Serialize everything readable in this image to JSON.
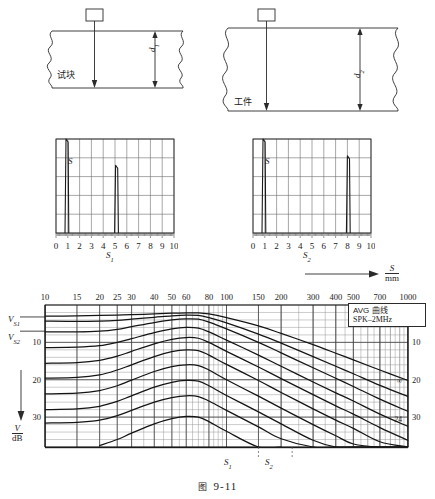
{
  "figure": {
    "caption_prefix": "图",
    "caption_number": "9-11"
  },
  "specimens": [
    {
      "name": "test-block",
      "material_label": "试块",
      "depth_label": "d",
      "depth_sub": "1",
      "probe_label": ""
    },
    {
      "name": "workpiece",
      "material_label": "工件",
      "depth_label": "d",
      "depth_sub": "2",
      "probe_label": ""
    }
  ],
  "scope_charts": [
    {
      "name": "scope-s1",
      "axis_label": "S",
      "axis_sub": "1",
      "signal_label": "S",
      "ticks": [
        "0",
        "1",
        "2",
        "3",
        "4",
        "5",
        "6",
        "7",
        "8",
        "9",
        "10"
      ],
      "xmin": 0,
      "xmax": 10,
      "echoes": [
        {
          "position": 0.95,
          "height": 1.0
        },
        {
          "position": 5.15,
          "height": 0.72
        }
      ],
      "grid_cols": 10,
      "grid_rows": 5
    },
    {
      "name": "scope-s2",
      "axis_label": "S",
      "axis_sub": "2",
      "signal_label": "S",
      "ticks": [
        "0",
        "1",
        "2",
        "3",
        "4",
        "5",
        "6",
        "7",
        "8",
        "9",
        "10"
      ],
      "xmin": 0,
      "xmax": 10,
      "echoes": [
        {
          "position": 0.95,
          "height": 1.0
        },
        {
          "position": 8.1,
          "height": 0.82
        }
      ],
      "grid_cols": 10,
      "grid_rows": 5
    }
  ],
  "chart_data": {
    "type": "line",
    "title": "AVG 曲线",
    "legend": [
      "AVG 曲线",
      "SPK–2MHz"
    ],
    "legend_position": "top-right-inside",
    "xlabel": "S",
    "xunit": "mm",
    "ylabel": "V",
    "yunit": "dB",
    "xscale": "log",
    "xlim": [
      10,
      1000
    ],
    "ylim": [
      0,
      38
    ],
    "grid": true,
    "xticks": [
      "10",
      "15",
      "20",
      "25",
      "30",
      "40",
      "50",
      "60",
      "80",
      "100",
      "150",
      "200",
      "300",
      "400",
      "500",
      "700",
      "1000"
    ],
    "xtick_values": [
      10,
      15,
      20,
      25,
      30,
      40,
      50,
      60,
      80,
      100,
      150,
      200,
      300,
      400,
      500,
      700,
      1000
    ],
    "yticks_left": [
      "10",
      "20",
      "30"
    ],
    "yticks_right": [
      "10",
      "20",
      "30"
    ],
    "ytick_values": [
      10,
      20,
      30
    ],
    "axis_arrow_label": "S",
    "axis_arrow_unit": "mm",
    "markers": [
      {
        "label": "V",
        "sub": "S1",
        "side": "left",
        "value": 3.2
      },
      {
        "label": "V",
        "sub": "S2",
        "side": "left",
        "value": 7.0
      },
      {
        "label": "S",
        "sub": "1",
        "side": "bottom",
        "value": 150
      },
      {
        "label": "S",
        "sub": "2",
        "side": "bottom",
        "value": 230
      }
    ],
    "curve_end_labels": [
      {
        "text": "∞",
        "value": 20.2
      },
      {
        "text": "24",
        "value": 30.4
      }
    ],
    "series": [
      {
        "name": "∞",
        "points": [
          [
            10,
            3.0
          ],
          [
            15,
            2.9
          ],
          [
            20,
            2.8
          ],
          [
            25,
            2.7
          ],
          [
            30,
            2.6
          ],
          [
            40,
            2.4
          ],
          [
            50,
            2.2
          ],
          [
            60,
            2.1
          ],
          [
            70,
            2.1
          ],
          [
            80,
            2.4
          ],
          [
            100,
            3.4
          ],
          [
            150,
            5.6
          ],
          [
            200,
            7.6
          ],
          [
            300,
            10.6
          ],
          [
            400,
            12.9
          ],
          [
            500,
            14.7
          ],
          [
            700,
            17.4
          ],
          [
            1000,
            20.2
          ]
        ]
      },
      {
        "name": "backwall-2",
        "points": [
          [
            10,
            4.3
          ],
          [
            15,
            4.4
          ],
          [
            20,
            4.3
          ],
          [
            25,
            4.1
          ],
          [
            30,
            3.8
          ],
          [
            40,
            3.3
          ],
          [
            50,
            2.9
          ],
          [
            60,
            2.7
          ],
          [
            70,
            2.8
          ],
          [
            80,
            3.4
          ],
          [
            100,
            4.8
          ],
          [
            150,
            7.8
          ],
          [
            200,
            10.2
          ],
          [
            300,
            13.8
          ],
          [
            400,
            16.4
          ],
          [
            500,
            18.4
          ],
          [
            700,
            21.5
          ],
          [
            1000,
            24.5
          ]
        ]
      },
      {
        "name": "curve-3",
        "points": [
          [
            10,
            7.2
          ],
          [
            15,
            7.2
          ],
          [
            20,
            7.0
          ],
          [
            25,
            6.5
          ],
          [
            30,
            5.8
          ],
          [
            40,
            4.7
          ],
          [
            50,
            4.0
          ],
          [
            60,
            3.7
          ],
          [
            70,
            3.8
          ],
          [
            80,
            4.6
          ],
          [
            100,
            6.4
          ],
          [
            150,
            10.0
          ],
          [
            200,
            12.8
          ],
          [
            300,
            16.8
          ],
          [
            400,
            19.6
          ],
          [
            500,
            21.8
          ],
          [
            700,
            25.2
          ],
          [
            1000,
            28.5
          ]
        ]
      },
      {
        "name": "curve-4",
        "points": [
          [
            10,
            11.4
          ],
          [
            15,
            11.3
          ],
          [
            20,
            10.9
          ],
          [
            25,
            10.0
          ],
          [
            30,
            9.0
          ],
          [
            40,
            7.4
          ],
          [
            50,
            6.4
          ],
          [
            60,
            6.0
          ],
          [
            70,
            6.2
          ],
          [
            80,
            7.2
          ],
          [
            100,
            9.4
          ],
          [
            150,
            13.4
          ],
          [
            200,
            16.4
          ],
          [
            300,
            20.6
          ],
          [
            400,
            23.5
          ],
          [
            500,
            25.7
          ],
          [
            700,
            29.2
          ],
          [
            1000,
            32.5
          ]
        ]
      },
      {
        "name": "curve-5",
        "points": [
          [
            10,
            15.6
          ],
          [
            15,
            15.4
          ],
          [
            20,
            14.8
          ],
          [
            25,
            13.7
          ],
          [
            30,
            12.4
          ],
          [
            40,
            10.4
          ],
          [
            50,
            9.2
          ],
          [
            60,
            8.7
          ],
          [
            70,
            8.9
          ],
          [
            80,
            10.0
          ],
          [
            100,
            12.4
          ],
          [
            150,
            16.6
          ],
          [
            200,
            19.7
          ],
          [
            300,
            24.0
          ],
          [
            400,
            27.0
          ],
          [
            500,
            29.2
          ],
          [
            700,
            32.8
          ],
          [
            1000,
            36.2
          ]
        ]
      },
      {
        "name": "curve-6",
        "points": [
          [
            10,
            19.6
          ],
          [
            15,
            19.4
          ],
          [
            20,
            18.7
          ],
          [
            25,
            17.4
          ],
          [
            30,
            16.0
          ],
          [
            40,
            13.8
          ],
          [
            50,
            12.5
          ],
          [
            60,
            12.0
          ],
          [
            70,
            12.2
          ],
          [
            80,
            13.4
          ],
          [
            100,
            15.9
          ],
          [
            150,
            20.2
          ],
          [
            200,
            23.4
          ],
          [
            300,
            27.8
          ],
          [
            400,
            30.8
          ],
          [
            500,
            33.0
          ],
          [
            700,
            36.6
          ],
          [
            1000,
            38.0
          ]
        ]
      },
      {
        "name": "curve-7",
        "points": [
          [
            10,
            23.8
          ],
          [
            15,
            23.6
          ],
          [
            20,
            22.9
          ],
          [
            25,
            21.6
          ],
          [
            30,
            20.1
          ],
          [
            40,
            17.8
          ],
          [
            50,
            16.5
          ],
          [
            60,
            16.0
          ],
          [
            70,
            16.2
          ],
          [
            80,
            17.4
          ],
          [
            100,
            20.0
          ],
          [
            150,
            24.4
          ],
          [
            200,
            27.6
          ],
          [
            300,
            32.0
          ],
          [
            400,
            35.0
          ],
          [
            500,
            37.2
          ],
          [
            700,
            38.0
          ],
          [
            1000,
            38.0
          ]
        ]
      },
      {
        "name": "curve-8",
        "points": [
          [
            10,
            28.0
          ],
          [
            15,
            27.8
          ],
          [
            20,
            27.1
          ],
          [
            25,
            25.8
          ],
          [
            30,
            24.3
          ],
          [
            40,
            22.0
          ],
          [
            50,
            20.7
          ],
          [
            60,
            20.2
          ],
          [
            70,
            20.4
          ],
          [
            80,
            21.6
          ],
          [
            100,
            24.2
          ],
          [
            150,
            28.6
          ],
          [
            200,
            31.8
          ],
          [
            300,
            36.2
          ],
          [
            400,
            38.0
          ],
          [
            500,
            38.0
          ],
          [
            700,
            38.0
          ],
          [
            1000,
            38.0
          ]
        ]
      },
      {
        "name": "curve-9",
        "points": [
          [
            10,
            31.6
          ],
          [
            15,
            31.4
          ],
          [
            20,
            30.8
          ],
          [
            25,
            29.6
          ],
          [
            30,
            28.2
          ],
          [
            40,
            26.0
          ],
          [
            50,
            24.8
          ],
          [
            60,
            24.3
          ],
          [
            70,
            24.5
          ],
          [
            80,
            25.7
          ],
          [
            100,
            28.2
          ],
          [
            150,
            32.6
          ],
          [
            200,
            35.8
          ],
          [
            300,
            38.0
          ],
          [
            400,
            38.0
          ],
          [
            500,
            38.0
          ],
          [
            700,
            38.0
          ],
          [
            1000,
            38.0
          ]
        ]
      },
      {
        "name": "curve-10",
        "points": [
          [
            20,
            37.6
          ],
          [
            25,
            36.0
          ],
          [
            30,
            34.3
          ],
          [
            40,
            31.8
          ],
          [
            50,
            30.4
          ],
          [
            60,
            29.8
          ],
          [
            70,
            30.0
          ],
          [
            80,
            31.2
          ],
          [
            100,
            33.8
          ],
          [
            150,
            38.0
          ],
          [
            200,
            38.0
          ]
        ]
      }
    ]
  }
}
